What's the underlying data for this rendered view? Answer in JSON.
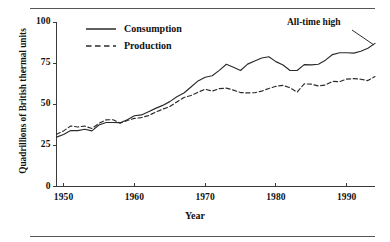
{
  "chart_data": {
    "type": "line",
    "title": "",
    "xlabel": "Year",
    "ylabel": "Quadrillions of British thermal units",
    "xlim": [
      1949,
      1994
    ],
    "ylim": [
      0,
      100
    ],
    "grid": false,
    "legend_position": "top-left-inside",
    "y_ticks": [
      "0",
      "25",
      "50",
      "75",
      "100"
    ],
    "y_tick_values": [
      0,
      25,
      50,
      75,
      100
    ],
    "x_ticks": [
      "1950",
      "1960",
      "1970",
      "1980",
      "1990"
    ],
    "x_tick_values": [
      1950,
      1960,
      1970,
      1980,
      1990
    ],
    "annotations": [
      {
        "text": "All-time high",
        "x": 1994,
        "y": 87
      }
    ],
    "x": [
      1949,
      1950,
      1951,
      1952,
      1953,
      1954,
      1955,
      1956,
      1957,
      1958,
      1959,
      1960,
      1961,
      1962,
      1963,
      1964,
      1965,
      1966,
      1967,
      1968,
      1969,
      1970,
      1971,
      1972,
      1973,
      1974,
      1975,
      1976,
      1977,
      1978,
      1979,
      1980,
      1981,
      1982,
      1983,
      1984,
      1985,
      1986,
      1987,
      1988,
      1989,
      1990,
      1991,
      1992,
      1993,
      1994
    ],
    "series": [
      {
        "name": "Consumption",
        "style": "solid",
        "values": [
          30.0,
          31.6,
          34.0,
          34.0,
          34.8,
          33.8,
          37.4,
          38.9,
          38.9,
          38.8,
          40.6,
          43.0,
          43.5,
          45.5,
          47.5,
          49.3,
          51.6,
          54.5,
          56.8,
          60.5,
          64.2,
          66.4,
          67.3,
          70.6,
          74.3,
          72.5,
          70.5,
          74.4,
          76.3,
          78.1,
          78.9,
          75.9,
          73.9,
          70.5,
          70.5,
          74.1,
          73.9,
          74.3,
          76.8,
          80.2,
          81.3,
          81.3,
          81.1,
          82.2,
          84.0,
          87.0
        ]
      },
      {
        "name": "Production",
        "style": "dashed",
        "values": [
          31.7,
          33.8,
          36.8,
          36.2,
          36.7,
          35.3,
          38.4,
          40.5,
          40.6,
          38.5,
          40.1,
          41.4,
          41.9,
          43.1,
          45.2,
          47.0,
          48.6,
          51.4,
          54.1,
          55.3,
          57.3,
          59.2,
          58.0,
          59.5,
          59.8,
          58.6,
          57.1,
          56.9,
          57.0,
          58.0,
          59.6,
          60.9,
          61.5,
          60.0,
          57.4,
          62.4,
          62.2,
          61.1,
          61.7,
          63.9,
          63.7,
          65.3,
          65.6,
          65.2,
          64.4,
          66.8
        ]
      }
    ]
  },
  "figure": {
    "y_axis_title": "Quadrillions of British thermal units",
    "x_axis_title": "Year",
    "annotation_label": "All-time high",
    "legend": [
      {
        "label": "Consumption",
        "style": "solid"
      },
      {
        "label": "Production",
        "style": "dashed"
      }
    ],
    "y_tick_labels": [
      "100",
      "75",
      "50",
      "25",
      "0"
    ],
    "x_tick_labels": [
      "1950",
      "1960",
      "1970",
      "1980",
      "1990"
    ],
    "colors": {
      "ink": "#2b2b2b",
      "rule": "#555555"
    }
  }
}
